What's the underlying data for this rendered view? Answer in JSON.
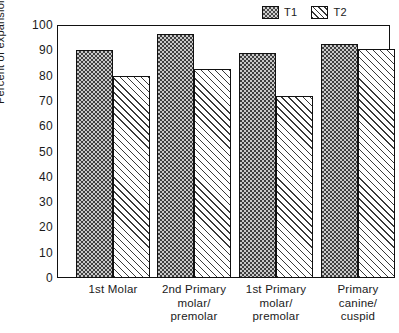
{
  "legend": {
    "position": "top-right",
    "entries": [
      {
        "label": "T1",
        "pattern": "checkerboard"
      },
      {
        "label": "T2",
        "pattern": "diagonal-hatch"
      }
    ]
  },
  "axes": {
    "y_title": "Percent of expansion",
    "y_ticks": [
      "100",
      "90",
      "80",
      "70",
      "60",
      "50",
      "40",
      "30",
      "20",
      "10",
      "0"
    ]
  },
  "chart_data": {
    "type": "bar",
    "title": "",
    "xlabel": "",
    "ylabel": "Percent of expansion",
    "ylim": [
      0,
      100
    ],
    "ytick_step": 10,
    "grid": false,
    "legend_position": "top-right",
    "categories": [
      "1st Molar",
      "2nd Primary molar/ premolar",
      "1st Primary molar/ premolar",
      "Primary canine/ cuspid"
    ],
    "category_lines": [
      [
        "1st Molar"
      ],
      [
        "2nd Primary",
        "molar/",
        "premolar"
      ],
      [
        "1st Primary",
        "molar/",
        "premolar"
      ],
      [
        "Primary",
        "canine/",
        "cuspid"
      ]
    ],
    "series": [
      {
        "name": "T1",
        "values": [
          90,
          96.5,
          89,
          92.5
        ]
      },
      {
        "name": "T2",
        "values": [
          80,
          82.5,
          72,
          90.5
        ]
      }
    ]
  }
}
